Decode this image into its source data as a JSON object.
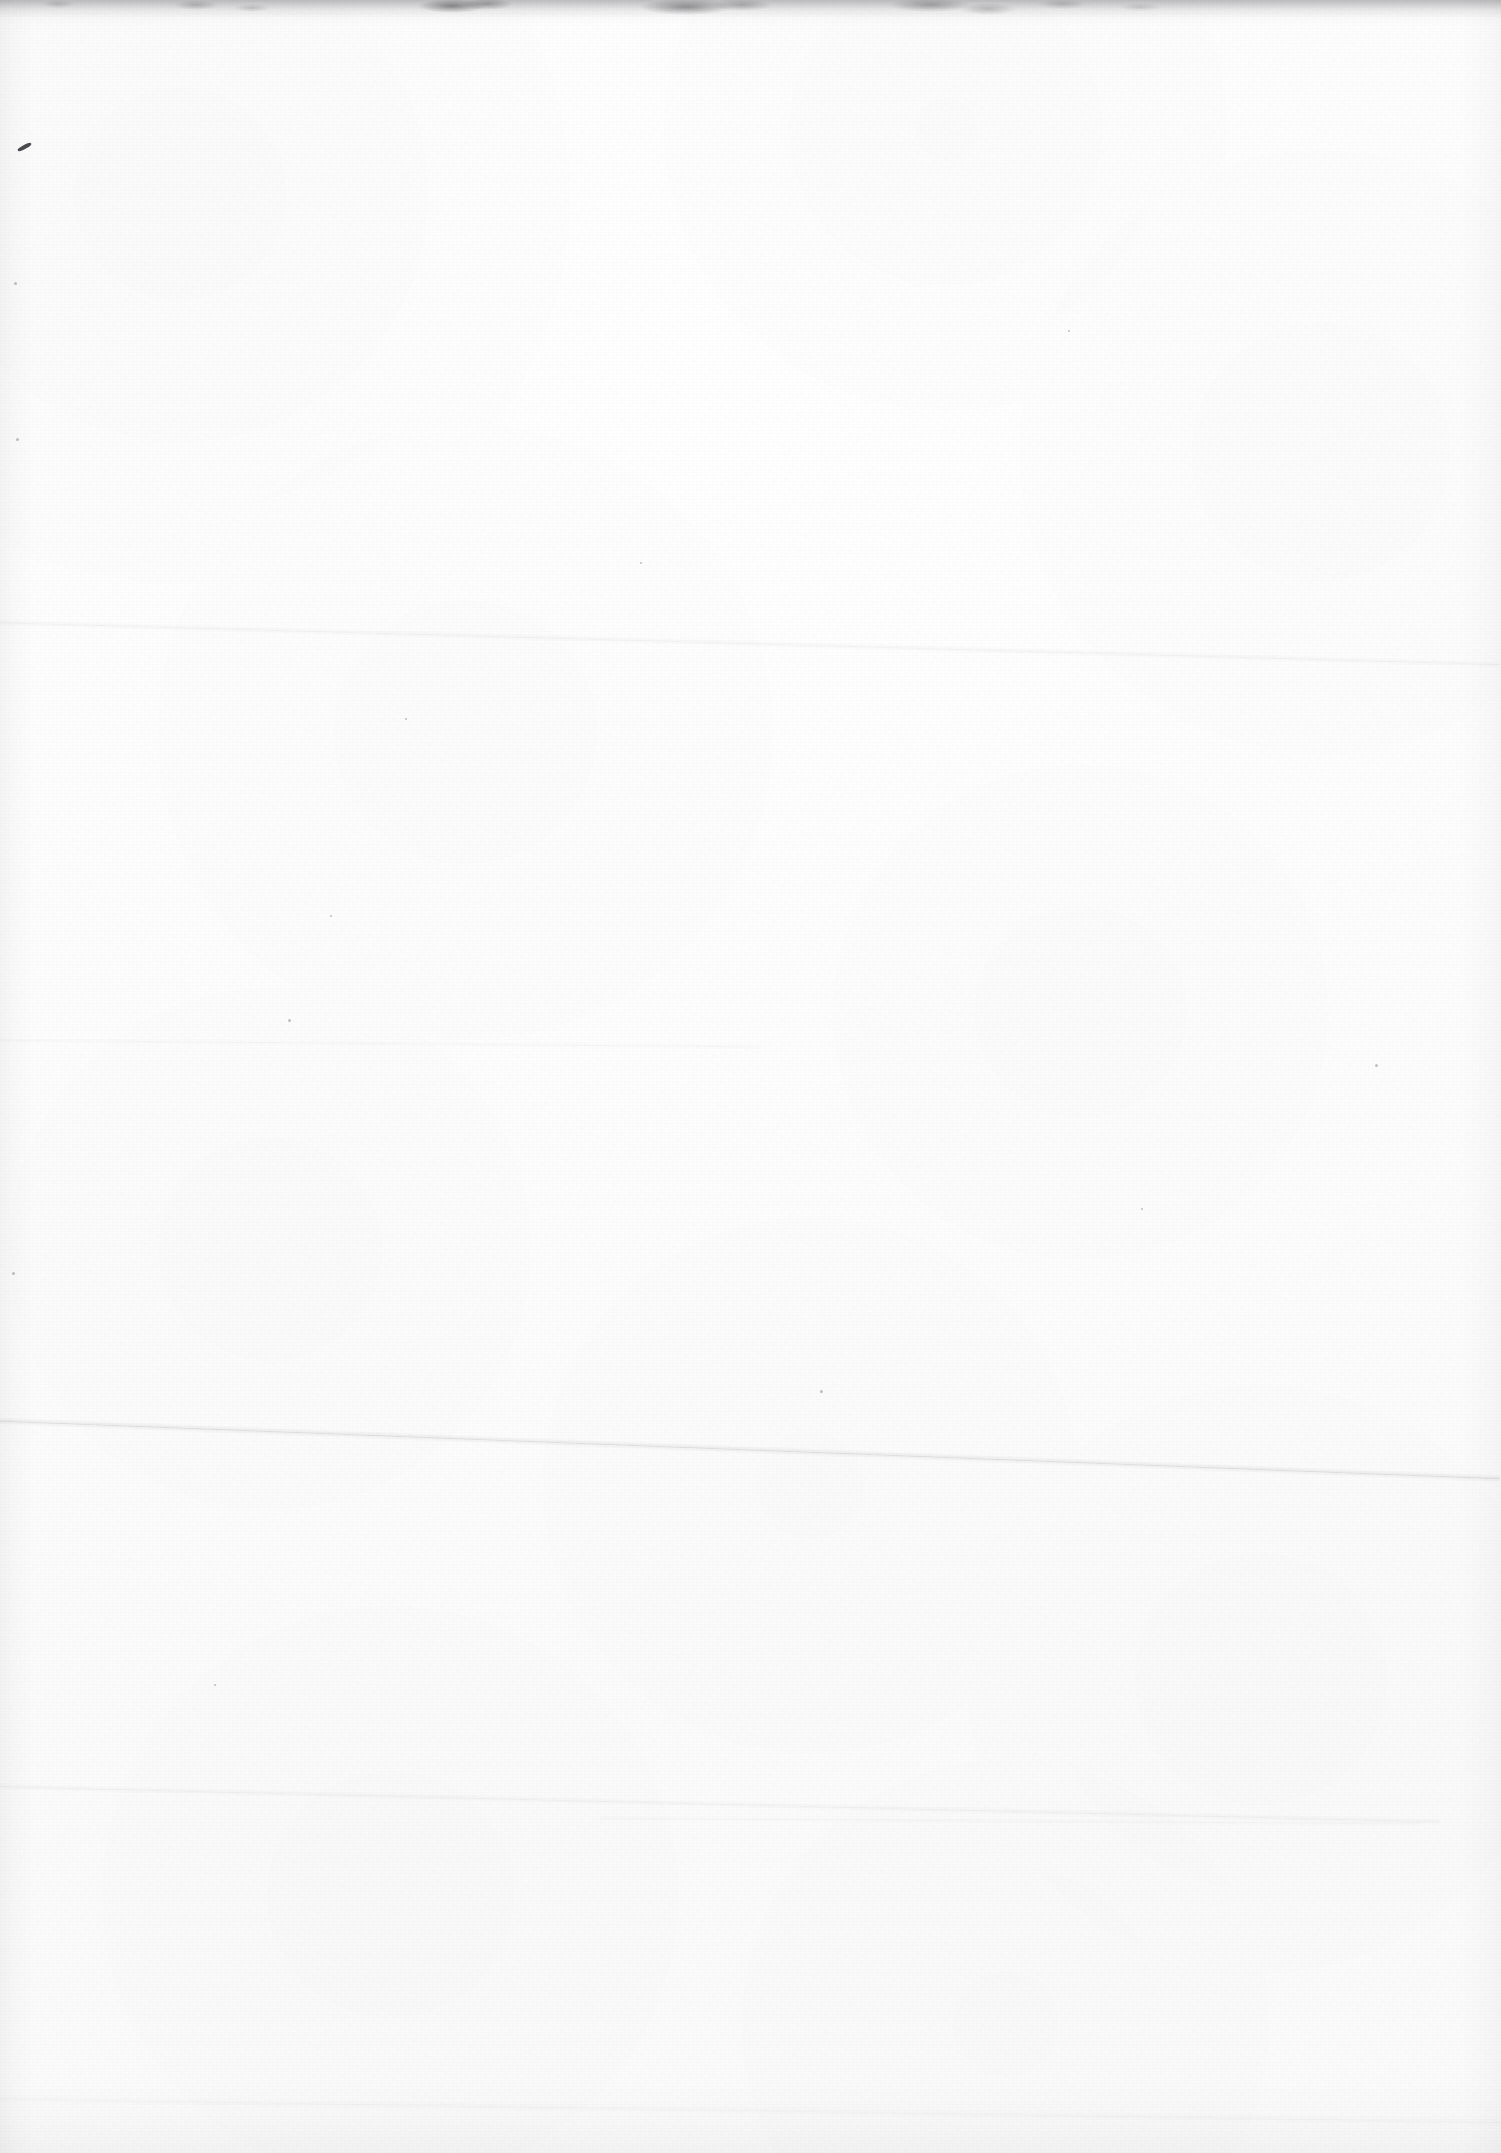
{
  "page": {
    "kind": "scanned-blank-page",
    "label": "Blank scanned page",
    "width": 1501,
    "height": 2153,
    "visible_text": "",
    "colors": {
      "paper": "#fdfdfd",
      "paper_highlight": "#ffffff",
      "paper_shadow": "#fafafa",
      "edge_grime": "#5a5a5f",
      "ink_mark": "#4a4a50",
      "crease": "#d8d8dc"
    }
  },
  "artifacts": {
    "edge_top_grime": {
      "name": "top-edge-grime",
      "height": 26
    },
    "edge_left_band": {
      "name": "left-edge-shading",
      "width": 34
    },
    "edge_right_band": {
      "name": "right-edge-shading",
      "width": 40
    },
    "edge_bottom_band": {
      "name": "bottom-edge-shading",
      "height": 70
    },
    "creases": [
      {
        "name": "crease-upper",
        "x": 0,
        "y": 622,
        "length": 1501,
        "angle": 1.6,
        "thickness": 7,
        "strength": "soft"
      },
      {
        "name": "crease-mid",
        "x": 0,
        "y": 1040,
        "length": 760,
        "angle": 0.5,
        "thickness": 6,
        "strength": "veryfaint"
      },
      {
        "name": "crease-main",
        "x": 0,
        "y": 1421,
        "length": 1501,
        "angle": 2.2,
        "thickness": 8,
        "strength": "strong"
      },
      {
        "name": "crease-lower",
        "x": 0,
        "y": 1786,
        "length": 1440,
        "angle": 1.4,
        "thickness": 7,
        "strength": "soft"
      },
      {
        "name": "crease-lower-short",
        "x": 600,
        "y": 1818,
        "length": 820,
        "angle": 0.4,
        "thickness": 6,
        "strength": "veryfaint"
      },
      {
        "name": "crease-bottom",
        "x": 0,
        "y": 2098,
        "length": 1501,
        "angle": 0.9,
        "thickness": 9,
        "strength": "veryfaint"
      }
    ],
    "ink_marks": [
      {
        "name": "pen-stroke-upper-left",
        "x": 17,
        "y": 145,
        "width": 15,
        "height": 4,
        "angle": -28
      }
    ],
    "specks": [
      {
        "name": "speck-a",
        "x": 14,
        "y": 282,
        "size": 3
      },
      {
        "name": "speck-b",
        "x": 16,
        "y": 438,
        "size": 3
      },
      {
        "name": "speck-c",
        "x": 12,
        "y": 1272,
        "size": 3
      },
      {
        "name": "speck-d",
        "x": 288,
        "y": 1019,
        "size": 3
      },
      {
        "name": "speck-e",
        "x": 1375,
        "y": 1064,
        "size": 3
      },
      {
        "name": "speck-f",
        "x": 405,
        "y": 718,
        "size": 2
      },
      {
        "name": "speck-g",
        "x": 640,
        "y": 562,
        "size": 2
      },
      {
        "name": "speck-h",
        "x": 1141,
        "y": 1208,
        "size": 2
      },
      {
        "name": "speck-i",
        "x": 820,
        "y": 1390,
        "size": 3
      },
      {
        "name": "speck-j",
        "x": 330,
        "y": 915,
        "size": 2
      },
      {
        "name": "speck-k",
        "x": 1068,
        "y": 330,
        "size": 2
      },
      {
        "name": "speck-l",
        "x": 214,
        "y": 1684,
        "size": 2
      }
    ]
  }
}
